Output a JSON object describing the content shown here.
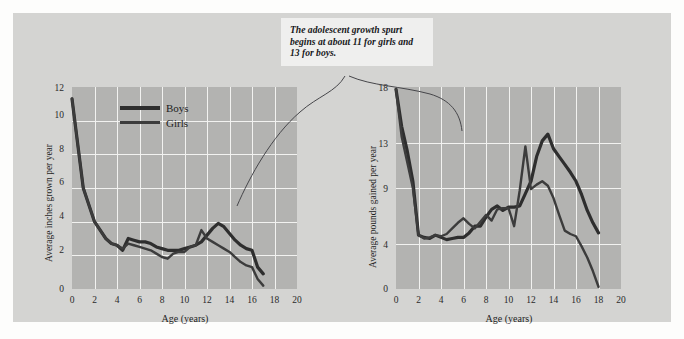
{
  "figure": {
    "background_color": "#d4d4d2",
    "plot_background_color": "#b3b3b1",
    "grid_color": "#f2f2f0",
    "boys_color": "#2e2e2e",
    "girls_color": "#3c3c3c"
  },
  "annotation": {
    "name": "growth-spurt-note",
    "text": "The adolescent growth spurt begins at about 11 for girls and 13 for boys."
  },
  "legend": {
    "position": "top-left-inside-left-chart",
    "entries": [
      {
        "label": "Boys",
        "color": "#2e2e2e"
      },
      {
        "label": "Girls",
        "color": "#3c3c3c"
      }
    ]
  },
  "chart_data": [
    {
      "id": "height-velocity",
      "type": "line",
      "title": "",
      "xlabel": "Age (years)",
      "ylabel": "Average inches grown per year",
      "xlim": [
        0,
        20
      ],
      "ylim": [
        0,
        12
      ],
      "xticks": [
        0,
        2,
        4,
        6,
        8,
        10,
        12,
        14,
        16,
        18,
        20
      ],
      "yticks": [
        0,
        2,
        4,
        6,
        8,
        10,
        12
      ],
      "grid": true,
      "legend_position": "upper-center",
      "series": [
        {
          "name": "Boys",
          "color": "#2e2e2e",
          "x": [
            0,
            1,
            2,
            3,
            3.5,
            4,
            4.5,
            5,
            5.5,
            6,
            6.5,
            7,
            7.5,
            8,
            8.5,
            9,
            9.5,
            10,
            10.5,
            11,
            11.5,
            12,
            12.5,
            13,
            13.5,
            14,
            14.5,
            15,
            15.5,
            16,
            16.5,
            17
          ],
          "y": [
            11.3,
            6.0,
            4.0,
            3.0,
            2.7,
            2.6,
            2.3,
            3.0,
            2.9,
            2.8,
            2.8,
            2.7,
            2.5,
            2.4,
            2.3,
            2.3,
            2.3,
            2.4,
            2.5,
            2.6,
            2.8,
            3.2,
            3.6,
            3.9,
            3.7,
            3.3,
            2.9,
            2.6,
            2.4,
            2.3,
            1.3,
            0.9
          ]
        },
        {
          "name": "Girls",
          "color": "#3c3c3c",
          "x": [
            0,
            1,
            2,
            3,
            3.5,
            4,
            4.5,
            5,
            5.5,
            6,
            6.5,
            7,
            7.5,
            8,
            8.5,
            9,
            9.5,
            10,
            10.5,
            11,
            11.5,
            12,
            12.5,
            13,
            13.5,
            14,
            14.5,
            15,
            15.5,
            16,
            16.5,
            17
          ],
          "y": [
            11.3,
            6.0,
            4.0,
            3.0,
            2.7,
            2.6,
            2.4,
            2.7,
            2.6,
            2.5,
            2.4,
            2.3,
            2.1,
            1.9,
            1.8,
            2.1,
            2.2,
            2.2,
            2.5,
            2.6,
            3.5,
            3.0,
            2.8,
            2.6,
            2.4,
            2.2,
            1.9,
            1.6,
            1.4,
            1.3,
            0.6,
            0.2
          ]
        }
      ]
    },
    {
      "id": "weight-velocity",
      "type": "line",
      "title": "",
      "xlabel": "Age (years)",
      "ylabel": "Average pounds gained per year",
      "xlim": [
        0,
        20
      ],
      "ylim": [
        0,
        18
      ],
      "xticks": [
        0,
        2,
        4,
        6,
        8,
        10,
        12,
        14,
        16,
        18,
        20
      ],
      "yticks": [
        0,
        4,
        9,
        13,
        18
      ],
      "grid": true,
      "legend_position": "none",
      "series": [
        {
          "name": "Boys",
          "color": "#2e2e2e",
          "x": [
            0,
            0.5,
            1,
            1.5,
            2,
            2.5,
            3,
            3.5,
            4,
            4.5,
            5,
            5.5,
            6,
            6.5,
            7,
            7.5,
            8,
            8.5,
            9,
            9.5,
            10,
            10.5,
            11,
            11.5,
            12,
            12.5,
            13,
            13.5,
            14,
            14.5,
            15,
            15.5,
            16,
            16.5,
            17,
            17.5,
            18
          ],
          "y": [
            17.8,
            14.5,
            12.3,
            9.6,
            4.8,
            4.6,
            4.5,
            4.8,
            4.6,
            4.4,
            4.5,
            4.6,
            4.6,
            5.0,
            5.6,
            5.6,
            6.4,
            7.1,
            7.4,
            7.0,
            7.3,
            7.3,
            7.4,
            8.5,
            9.6,
            11.8,
            13.2,
            13.8,
            12.5,
            11.8,
            11.1,
            10.4,
            9.6,
            8.4,
            7.0,
            5.9,
            5.0
          ]
        },
        {
          "name": "Girls",
          "color": "#3c3c3c",
          "x": [
            0,
            0.5,
            1,
            1.5,
            2,
            2.5,
            3,
            3.5,
            4,
            4.5,
            5,
            5.5,
            6,
            6.5,
            7,
            7.5,
            8,
            8.5,
            9,
            9.5,
            10,
            10.5,
            11,
            11.5,
            12,
            12.5,
            13,
            13.5,
            14,
            14.5,
            15,
            15.5,
            16,
            16.5,
            17,
            17.5,
            18
          ],
          "y": [
            17.8,
            13.6,
            11.3,
            9.0,
            4.8,
            4.5,
            4.6,
            4.8,
            4.7,
            4.9,
            5.4,
            5.9,
            6.3,
            5.8,
            5.4,
            6.0,
            6.6,
            6.1,
            7.1,
            7.2,
            7.2,
            5.6,
            8.8,
            12.7,
            8.9,
            9.3,
            9.6,
            9.2,
            8.1,
            6.6,
            5.2,
            4.9,
            4.7,
            3.8,
            2.8,
            1.6,
            0.2
          ]
        }
      ]
    }
  ]
}
